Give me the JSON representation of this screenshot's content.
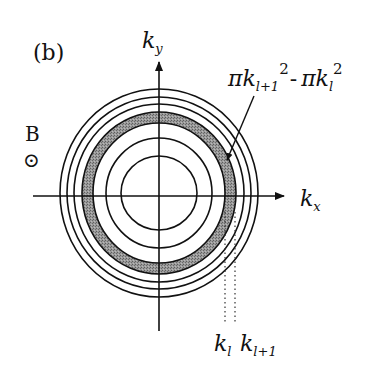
{
  "figure": {
    "panel_label": "(b)",
    "field_label": "B",
    "field_symbol": "⊙",
    "axes": {
      "y_label_main": "k",
      "y_label_sub": "y",
      "x_label_main": "k",
      "x_label_sub": "x"
    },
    "annotation": {
      "pi1": "π",
      "k1": "k",
      "sub1": "l+1",
      "sup1": "2",
      "minus": "-",
      "pi2": "π",
      "k2": "k",
      "sub2": "l",
      "sup2": "2"
    },
    "radius_labels": {
      "kl_main": "k",
      "kl_sub": "l",
      "kl1_main": "k",
      "kl1_sub": "l+1"
    },
    "circles_count": 7,
    "shaded_band": "between k_l and k_{l+1}",
    "colors": {
      "line": "#111111",
      "band": "#8a8a8a",
      "background": "#ffffff"
    }
  }
}
